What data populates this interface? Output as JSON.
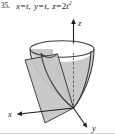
{
  "figure": {
    "problem_number": "35.",
    "equation": {
      "full_text": "x = t, y = t, z = 2t²",
      "x_part": "x",
      "x_value": "t",
      "y_part": "y",
      "y_value": "t",
      "z_part": "z",
      "z_coefficient": "2",
      "z_variable": "t",
      "z_exponent": "2",
      "equals": "=",
      "comma": ","
    },
    "axes": {
      "x_label": "x",
      "y_label": "y",
      "z_label": "z"
    },
    "surfaces": {
      "paraboloid_label": "paraboloid",
      "plane_label": "vertical plane"
    },
    "colors": {
      "ink": "#1c1c1c",
      "outline": "#3a3a3a",
      "plane_fill": "#c8c8c8",
      "paraboloid_fill": "#b9b9b9",
      "paraboloid_inner": "#d6d6d6",
      "axis": "#2b2b2b",
      "number_gray": "#6d6d6d",
      "rule": "#cfcfcf",
      "background": "#ffffff"
    }
  }
}
